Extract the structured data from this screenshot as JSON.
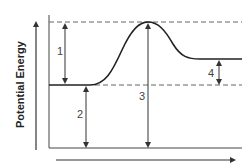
{
  "diagram": {
    "type": "potential-energy-reaction-diagram",
    "y_axis_label": "Potential Energy",
    "x_axis_label": "",
    "arrows": [
      {
        "id": "1",
        "label": "1",
        "from": "reactant-level",
        "to": "peak"
      },
      {
        "id": "2",
        "label": "2",
        "from": "baseline",
        "to": "reactant-level"
      },
      {
        "id": "3",
        "label": "3",
        "from": "baseline",
        "to": "peak"
      },
      {
        "id": "4",
        "label": "4",
        "from": "reactant-level",
        "to": "product-level"
      }
    ],
    "colors": {
      "line": "#333333",
      "dashed": "#666666",
      "background": "#ffffff"
    }
  }
}
